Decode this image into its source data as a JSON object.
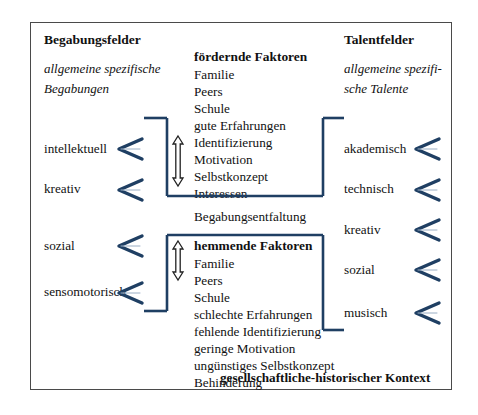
{
  "diagram": {
    "title_left": "Begabungsfelder",
    "title_right": "Talentfelder",
    "subtitle_left_line1": "allgemeine  spezifische",
    "subtitle_left_line2": "Begabungen",
    "subtitle_right_line1": "allgemeine  spezifi-",
    "subtitle_right_line2": "sche Talente",
    "promoting": {
      "heading": "fördernde Faktoren",
      "items": [
        "Familie",
        "Peers",
        "Schule",
        "gute Erfahrungen",
        "Identifizierung",
        "Motivation",
        "Selbstkonzept",
        "Interessen"
      ]
    },
    "middle_label": "Begabungsentfaltung",
    "hindering": {
      "heading": "hemmende Faktoren",
      "items": [
        "Familie",
        "Peers",
        "Schule",
        "schlechte Erfahrungen",
        "fehlende Identifizierung",
        "geringe Motivation",
        "ungünstiges Selbstkonzept",
        "Behinderung"
      ]
    },
    "left_fields": [
      "intellektuell",
      "kreativ",
      "sozial",
      "sensomotorisch"
    ],
    "right_fields": [
      "akademisch",
      "technisch",
      "kreativ",
      "sozial",
      "musisch"
    ],
    "footer": "gesellschaftliche-historischer Kontext",
    "colors": {
      "accent_blue": "#1f3f63",
      "frame": "#4a4a4a",
      "text": "#111111"
    }
  }
}
